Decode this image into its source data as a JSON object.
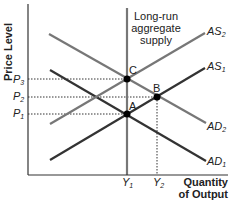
{
  "diagram": {
    "type": "economics-ad-as",
    "y_axis_label": "Price Level",
    "x_axis_label_line1": "Quantity",
    "x_axis_label_line2": "of Output",
    "lras_label_line1": "Long-run",
    "lras_label_line2": "aggregate",
    "lras_label_line3": "supply",
    "curves": {
      "as2": {
        "base": "AS",
        "sub": "2"
      },
      "as1": {
        "base": "AS",
        "sub": "1"
      },
      "ad2": {
        "base": "AD",
        "sub": "2"
      },
      "ad1": {
        "base": "AD",
        "sub": "1"
      }
    },
    "price_ticks": {
      "p3": {
        "base": "P",
        "sub": "3"
      },
      "p2": {
        "base": "P",
        "sub": "2"
      },
      "p1": {
        "base": "P",
        "sub": "1"
      }
    },
    "quantity_ticks": {
      "y1": {
        "base": "Y",
        "sub": "1"
      },
      "y2": {
        "base": "Y",
        "sub": "2"
      }
    },
    "points": {
      "a": "A",
      "b": "B",
      "c": "C"
    },
    "colors": {
      "axis": "#333333",
      "lras": "#777777",
      "as2": "#777777",
      "as1": "#333333",
      "ad2": "#777777",
      "ad1": "#333333",
      "point": "#000000"
    }
  }
}
